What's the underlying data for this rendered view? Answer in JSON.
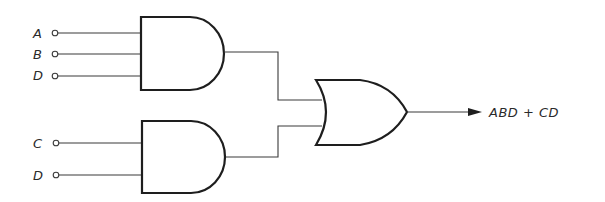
{
  "diagram": {
    "type": "logic-circuit",
    "inputs": [
      {
        "label": "A",
        "gate": "and1"
      },
      {
        "label": "B",
        "gate": "and1"
      },
      {
        "label": "D",
        "gate": "and1"
      },
      {
        "label": "C",
        "gate": "and2"
      },
      {
        "label": "D",
        "gate": "and2"
      }
    ],
    "gates": [
      {
        "id": "and1",
        "kind": "AND",
        "inputs": [
          "A",
          "B",
          "D"
        ]
      },
      {
        "id": "and2",
        "kind": "AND",
        "inputs": [
          "C",
          "D"
        ]
      },
      {
        "id": "or1",
        "kind": "OR",
        "inputs": [
          "and1",
          "and2"
        ]
      }
    ],
    "output": {
      "label": "ABD + CD"
    }
  }
}
